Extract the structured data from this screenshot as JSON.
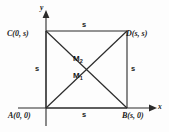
{
  "figure": {
    "stroke_color": "#2b2b2b",
    "background_color": "#fdfdfd",
    "axes": {
      "x_label": "x",
      "y_label": "y",
      "x_axis_name": "x-axis",
      "y_axis_name": "y-axis",
      "arrowhead": "triangle"
    },
    "vertices": [
      {
        "id": "A",
        "label": "A(0, 0)",
        "x": 0,
        "y": 0
      },
      {
        "id": "B",
        "label": "B(s, 0)",
        "x": 1,
        "y": 0
      },
      {
        "id": "C",
        "label": "C(0, s)",
        "x": 0,
        "y": 1
      },
      {
        "id": "D",
        "label": "D(s, s)",
        "x": 1,
        "y": 1
      }
    ],
    "side_labels": {
      "top": "s",
      "bottom": "s",
      "left": "s",
      "right": "s"
    },
    "midpoints": [
      {
        "id": "M2",
        "base": "M",
        "subscript": "2"
      },
      {
        "id": "M1",
        "base": "M",
        "subscript": "1"
      }
    ],
    "edges": [
      "AB",
      "BD",
      "DC",
      "CA"
    ],
    "diagonals": [
      "AD",
      "CB"
    ]
  }
}
